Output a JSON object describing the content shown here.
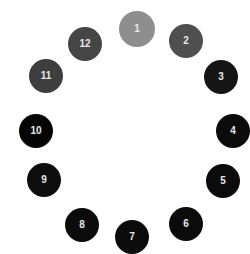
{
  "diagram": {
    "type": "clock-dot-sequence",
    "dots": [
      {
        "label": "1",
        "x": 137,
        "y": 29,
        "r": 18,
        "color": "#8e8e8e"
      },
      {
        "label": "2",
        "x": 186,
        "y": 41,
        "r": 17,
        "color": "#4f4f4f"
      },
      {
        "label": "3",
        "x": 221,
        "y": 77,
        "r": 17,
        "color": "#151515"
      },
      {
        "label": "4",
        "x": 233,
        "y": 131,
        "r": 17,
        "color": "#0b0b0b"
      },
      {
        "label": "5",
        "x": 223,
        "y": 181,
        "r": 17,
        "color": "#0b0b0b"
      },
      {
        "label": "6",
        "x": 186,
        "y": 224,
        "r": 17,
        "color": "#0b0b0b"
      },
      {
        "label": "7",
        "x": 132,
        "y": 237,
        "r": 17,
        "color": "#0b0b0b"
      },
      {
        "label": "8",
        "x": 82,
        "y": 225,
        "r": 17,
        "color": "#0b0b0b"
      },
      {
        "label": "9",
        "x": 44,
        "y": 180,
        "r": 17,
        "color": "#0d0d0d"
      },
      {
        "label": "10",
        "x": 36,
        "y": 131,
        "r": 17,
        "color": "#050505"
      },
      {
        "label": "11",
        "x": 46,
        "y": 76,
        "r": 17,
        "color": "#3e3e3e"
      },
      {
        "label": "12",
        "x": 85,
        "y": 44,
        "r": 17,
        "color": "#454545"
      }
    ]
  }
}
